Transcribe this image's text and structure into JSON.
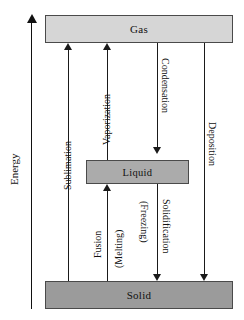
{
  "diagram": {
    "axis": {
      "label": "Energy",
      "direction": "up",
      "arrow_icon": "arrow-up-icon"
    },
    "phases": [
      {
        "id": "gas",
        "label": "Gas",
        "fill": "#d6d6d6"
      },
      {
        "id": "liquid",
        "label": "Liquid",
        "fill": "#ababab"
      },
      {
        "id": "solid",
        "label": "Solid",
        "fill": "#9b9b9b"
      }
    ],
    "transitions": [
      {
        "id": "sublimation",
        "label": "Sublimation",
        "from": "solid",
        "to": "gas",
        "direction": "up",
        "alt_label": ""
      },
      {
        "id": "vaporization",
        "label": "Vaporization",
        "from": "liquid",
        "to": "gas",
        "direction": "up",
        "alt_label": ""
      },
      {
        "id": "condensation",
        "label": "Condensation",
        "from": "gas",
        "to": "liquid",
        "direction": "down",
        "alt_label": ""
      },
      {
        "id": "deposition",
        "label": "Deposition",
        "from": "gas",
        "to": "solid",
        "direction": "down",
        "alt_label": ""
      },
      {
        "id": "fusion",
        "label": "Fusion",
        "from": "solid",
        "to": "liquid",
        "direction": "up",
        "alt_label": "(Melting)"
      },
      {
        "id": "solidification",
        "label": "Solidification",
        "from": "liquid",
        "to": "solid",
        "direction": "down",
        "alt_label": "(Freezing)"
      }
    ],
    "colors": {
      "stroke": "#1a1a1a",
      "box_border": "#4a4a4a",
      "background": "#ffffff"
    }
  }
}
